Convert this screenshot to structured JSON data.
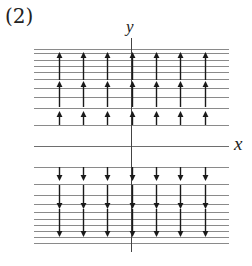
{
  "figure": {
    "label": "(2)",
    "axes": {
      "x_label": "x",
      "y_label": "y"
    },
    "colors": {
      "line": "#8a8a8a",
      "arrow": "#1a1a1a",
      "axis": "#555555"
    },
    "upper_lines_y": [
      49,
      53,
      60,
      66,
      72,
      79,
      88,
      97,
      108,
      125
    ],
    "x_axis_y": 146,
    "lower_lines_y": [
      167,
      184,
      195,
      204,
      212,
      219,
      225,
      231,
      237,
      243
    ],
    "arrow_columns_x": [
      59,
      83,
      107,
      132,
      156,
      180,
      205
    ],
    "upper_arrows": [
      {
        "direction": "up",
        "from_y": 125,
        "to_y": 114
      },
      {
        "direction": "up",
        "from_y": 107,
        "to_y": 84
      },
      {
        "direction": "up",
        "from_y": 80,
        "to_y": 55
      }
    ],
    "lower_arrows": [
      {
        "direction": "down",
        "from_y": 167,
        "to_y": 178
      },
      {
        "direction": "down",
        "from_y": 185,
        "to_y": 206
      },
      {
        "direction": "down",
        "from_y": 209,
        "to_y": 234
      }
    ]
  }
}
